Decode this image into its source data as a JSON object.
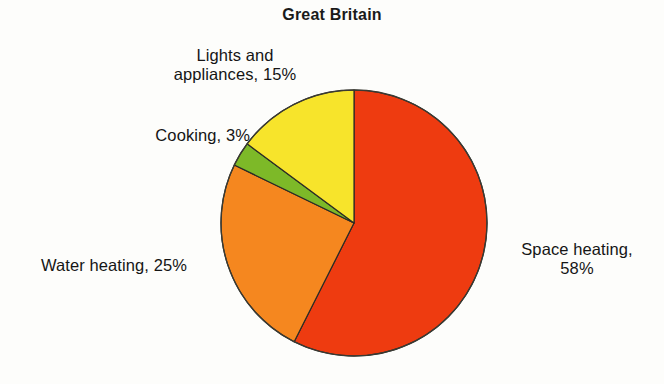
{
  "chart_data": {
    "type": "pie",
    "title": "Great Britain",
    "xlabel": "",
    "ylabel": "",
    "legend_position": "none",
    "grid": false,
    "unit": "%",
    "start_angle_deg": 0,
    "direction": "clockwise",
    "categories": [
      "Space heating",
      "Water heating",
      "Cooking",
      "Lights and appliances"
    ],
    "values": [
      58,
      25,
      3,
      15
    ],
    "colors": [
      "#ee3b10",
      "#f5871f",
      "#7db928",
      "#f7e42b"
    ],
    "slices": [
      {
        "name": "Space heating",
        "value": 58,
        "color": "#ee3b10",
        "label_line1": "Space heating,",
        "label_line2": "58%",
        "label_text": "Space heating, 58%"
      },
      {
        "name": "Water heating",
        "value": 25,
        "color": "#f5871f",
        "label_line1": "Water heating, 25%",
        "label_line2": "",
        "label_text": "Water heating, 25%"
      },
      {
        "name": "Cooking",
        "value": 3,
        "color": "#7db928",
        "label_line1": "Cooking, 3%",
        "label_line2": "",
        "label_text": "Cooking, 3%"
      },
      {
        "name": "Lights and appliances",
        "value": 15,
        "color": "#f7e42b",
        "label_line1": "Lights and",
        "label_line2": "appliances, 15%",
        "label_text": "Lights and appliances, 15%"
      }
    ]
  },
  "figure": {
    "title": "Great Britain",
    "background_color": "#fdfdfb",
    "outline_color": "#2b2b26"
  },
  "labels": {
    "lights": "Lights and\nappliances, 15%",
    "cooking": "Cooking, 3%",
    "water": "Water heating, 25%",
    "space": "Space heating,\n58%"
  }
}
